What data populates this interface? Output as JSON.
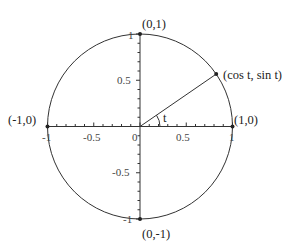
{
  "diagram": {
    "center_px": [
      140,
      126.5
    ],
    "radius_px": 92.5,
    "angle_deg": 34.5,
    "angle_label": "t",
    "colors": {
      "stroke": "#333333",
      "text": "#222222",
      "tick_text": "#444444",
      "background": "#ffffff"
    },
    "points": [
      {
        "id": "top",
        "label": "(0,1)",
        "coords": [
          0,
          1
        ]
      },
      {
        "id": "bottom",
        "label": "(0,-1)",
        "coords": [
          0,
          -1
        ]
      },
      {
        "id": "left",
        "label": "(-1,0)",
        "coords": [
          -1,
          0
        ]
      },
      {
        "id": "right",
        "label": "(1,0)",
        "coords": [
          1,
          0
        ]
      },
      {
        "id": "terminal",
        "label": "(cos t, sin t)",
        "coords": [
          "cos t",
          "sin t"
        ]
      }
    ],
    "x_axis": {
      "range": [
        -1,
        1
      ],
      "major_ticks": [
        "-1",
        "-0.5",
        "0",
        "0.5",
        "1"
      ],
      "minor_step": 0.1
    },
    "y_axis": {
      "range": [
        -1,
        1
      ],
      "major_ticks": [
        "1",
        "0.5",
        "-0.5",
        "-1"
      ],
      "minor_step": 0.1
    }
  }
}
